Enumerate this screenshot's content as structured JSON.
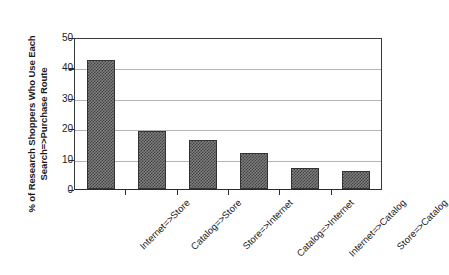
{
  "chart_data": {
    "type": "bar",
    "title": "",
    "xlabel": "",
    "ylabel": "% of Research Shoppers Who Use Each Search=>Purchase Route",
    "ylabel_lines": [
      "% of Research Shoppers Who Use Each",
      "Search=>Purchase Route"
    ],
    "categories": [
      "Internet=>Store",
      "Catalog=>Store",
      "Store=>Internet",
      "Catalog=>Internet",
      "Internet=>Catalog",
      "Store=>Catalog"
    ],
    "values": [
      43,
      19.5,
      16.5,
      12,
      7,
      6
    ],
    "ylim": [
      0,
      50
    ],
    "ytick_labels": [
      "50",
      "40",
      "30",
      "20",
      "10",
      "0"
    ],
    "ytick_values": [
      50,
      40,
      30,
      20,
      10,
      0
    ],
    "grid": true,
    "legend": false,
    "colors": {
      "bar_fill": "#7d7d7d",
      "bar_pattern": "#424242",
      "bar_outline": "#333333",
      "gridline": "#b4b4b4",
      "axis": "#2b2b2b",
      "text": "#1a1a1a",
      "background": "#ffffff"
    }
  }
}
